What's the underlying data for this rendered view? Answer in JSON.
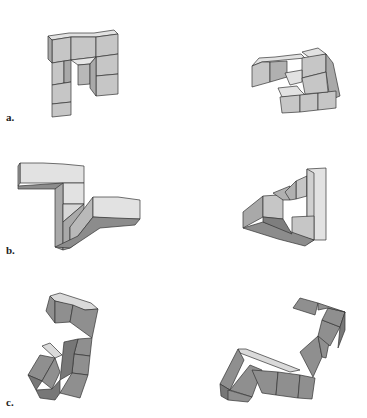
{
  "figure": {
    "colors": {
      "top_light": "#e2e2e2",
      "front_mid": "#c6c6c6",
      "side_dark": "#a9a9a9",
      "shadow": "#8c8c8c",
      "c_top": "#dadada",
      "c_front": "#8f8f8f",
      "c_side": "#777777",
      "edge": "#333333"
    },
    "rows": [
      {
        "id": "a",
        "label": "a.",
        "label_pos": [
          6,
          118
        ]
      },
      {
        "id": "b",
        "label": "b.",
        "label_pos": [
          6,
          250
        ]
      },
      {
        "id": "c",
        "label": "c.",
        "label_pos": [
          6,
          400
        ]
      }
    ],
    "polygons": [
      {
        "f": "#e2e2e2",
        "p": "48,36 69,33 94,33 114,30 118,34 96,37 71,37 52,40"
      },
      {
        "f": "#c6c6c6",
        "p": "52,40 71,37 71,60 52,63"
      },
      {
        "f": "#c6c6c6",
        "p": "71,37 96,37 96,57 71,60"
      },
      {
        "f": "#c6c6c6",
        "p": "96,37 118,34 118,54 96,57"
      },
      {
        "f": "#a9a9a9",
        "p": "48,36 52,40 52,63 48,59"
      },
      {
        "f": "#c6c6c6",
        "p": "52,63 64,61 64,83 52,85"
      },
      {
        "f": "#a9a9a9",
        "p": "64,61 71,60 71,82 64,83"
      },
      {
        "f": "#c6c6c6",
        "p": "52,85 71,82 71,102 52,104"
      },
      {
        "f": "#c6c6c6",
        "p": "52,104 71,102 71,115 52,117"
      },
      {
        "f": "#e6e6e6",
        "p": "71,60 96,57 90,64 78,65"
      },
      {
        "f": "#b8b8b8",
        "p": "78,65 90,64 90,84 78,85"
      },
      {
        "f": "#c6c6c6",
        "p": "96,57 118,54 118,74 96,76"
      },
      {
        "f": "#c6c6c6",
        "p": "96,76 118,74 118,94 96,96"
      },
      {
        "f": "#a9a9a9",
        "p": "90,64 96,57 96,96 90,88"
      },
      {
        "f": "#e2e2e2",
        "p": "252,66 259,58 275,57 292,55 301,54 305,58 262,62"
      },
      {
        "f": "#c6c6c6",
        "p": "252,66 262,62 270,62 270,82 252,87"
      },
      {
        "f": "#b0b0b0",
        "p": "270,62 287,61 287,77 270,82"
      },
      {
        "f": "#e2e2e2",
        "p": "302,52 318,48 326,54 310,58"
      },
      {
        "f": "#c6c6c6",
        "p": "302,58 326,54 326,72 302,78"
      },
      {
        "f": "#a9a9a9",
        "p": "326,54 333,63 340,96 330,100 326,72"
      },
      {
        "f": "#e2e2e2",
        "p": "285,73 302,70 302,82 290,85"
      },
      {
        "f": "#e2e2e2",
        "p": "278,88 297,86 300,90 305,95 282,97"
      },
      {
        "f": "#c6c6c6",
        "p": "280,97 300,95 300,112 282,113"
      },
      {
        "f": "#c6c6c6",
        "p": "300,95 318,93 318,110 300,112"
      },
      {
        "f": "#c6c6c6",
        "p": "318,93 336,91 336,108 318,110"
      },
      {
        "f": "#c6c6c6",
        "p": "302,78 326,72 328,92 305,94"
      },
      {
        "f": "#e2e2e2",
        "p": "20,163 43,163 63,164 84,166 84,183 63,183 43,183 20,183"
      },
      {
        "f": "#a9a9a9",
        "p": "18,166 20,163 20,183 18,186"
      },
      {
        "f": "#8c8c8c",
        "p": "18,186 63,183 60,189 18,189"
      },
      {
        "f": "#e2e2e2",
        "p": "63,183 84,183 84,204 63,204"
      },
      {
        "f": "#a9a9a9",
        "p": "55,189 63,183 63,250 55,247"
      },
      {
        "f": "#d8d8d8",
        "p": "63,204 84,204 63,222"
      },
      {
        "f": "#a9a9a9",
        "p": "63,222 84,204 84,215 70,227 70,248 63,250"
      },
      {
        "f": "#b9b9b9",
        "p": "70,227 93,197 93,217 78,236 78,242 70,248"
      },
      {
        "f": "#e2e2e2",
        "p": "93,197 118,197 140,200 140,219 118,219 93,217"
      },
      {
        "f": "#8c8c8c",
        "p": "78,236 93,217 140,219 135,225 100,228 70,248 55,247"
      },
      {
        "f": "#a9a9a9",
        "p": "243,212 263,196 263,217 243,228"
      },
      {
        "f": "#c6c6c6",
        "p": "263,196 278,195 283,200 283,219 263,217"
      },
      {
        "f": "#b0b0b0",
        "p": "273,193 290,186 290,200 283,200"
      },
      {
        "f": "#c6c6c6",
        "p": "296,181 307,176 307,196 296,199"
      },
      {
        "f": "#b0b0b0",
        "p": "285,192 296,181 296,199 290,200"
      },
      {
        "f": "#e2e2e2",
        "p": "307,169 326,168 326,240 307,240"
      },
      {
        "f": "#d0d0d0",
        "p": "307,169 314,173 314,240 307,244"
      },
      {
        "f": "#c6c6c6",
        "p": "292,217 314,216 314,240 292,234"
      },
      {
        "f": "#8c8c8c",
        "p": "243,228 263,222 314,240 305,246 278,239"
      },
      {
        "f": "#7e7e7e",
        "p": "263,217 283,219 292,234 263,222"
      },
      {
        "f": "#dadada",
        "p": "50,296 60,293 91,303 98,309 85,310 55,301"
      },
      {
        "f": "#8f8f8f",
        "p": "46,311 50,296 55,301 55,323"
      },
      {
        "f": "#8f8f8f",
        "p": "55,301 73,305 70,322 55,323"
      },
      {
        "f": "#8f8f8f",
        "p": "73,305 85,310 98,309 92,338 70,322"
      },
      {
        "f": "#8f8f8f",
        "p": "78,339 92,338 90,356 74,354"
      },
      {
        "f": "#8f8f8f",
        "p": "74,354 90,356 88,375 72,373"
      },
      {
        "f": "#8f8f8f",
        "p": "72,373 88,375 80,398 60,393"
      },
      {
        "f": "#777777",
        "p": "64,342 78,339 74,354 72,373 60,380"
      },
      {
        "f": "#dadada",
        "p": "42,346 50,343 62,355 55,358"
      },
      {
        "f": "#8f8f8f",
        "p": "28,375 40,355 55,358 42,381"
      },
      {
        "f": "#777777",
        "p": "28,375 42,381 36,390"
      },
      {
        "f": "#8f8f8f",
        "p": "42,381 55,358 60,372 52,389"
      },
      {
        "f": "#777777",
        "p": "36,390 52,389 60,380 60,393 55,400 40,398"
      },
      {
        "f": "#dadada",
        "p": "238,349 246,349 290,366 300,370 290,372 240,353"
      },
      {
        "f": "#8f8f8f",
        "p": "220,384 238,349 244,360 230,390"
      },
      {
        "f": "#8f8f8f",
        "p": "230,390 250,365 262,370 252,397"
      },
      {
        "f": "#8f8f8f",
        "p": "252,370 278,372 276,395 262,393"
      },
      {
        "f": "#8f8f8f",
        "p": "278,372 300,375 298,398 276,395"
      },
      {
        "f": "#8f8f8f",
        "p": "300,375 315,378 312,399 298,398"
      },
      {
        "f": "#777777",
        "p": "220,384 230,390 228,400 221,396"
      },
      {
        "f": "#8f8f8f",
        "p": "228,390 252,397 248,402 228,400"
      },
      {
        "f": "#8f8f8f",
        "p": "300,352 318,336 322,357 313,377"
      },
      {
        "f": "#8f8f8f",
        "p": "318,336 330,338 326,358 322,357"
      },
      {
        "f": "#8f8f8f",
        "p": "322,320 340,327 330,346 318,336"
      },
      {
        "f": "#8f8f8f",
        "p": "328,308 345,312 340,327 322,320"
      },
      {
        "f": "#8f8f8f",
        "p": "293,308 300,298 318,303 315,315"
      },
      {
        "f": "#8f8f8f",
        "p": "318,303 345,312 328,308 318,310"
      },
      {
        "f": "#777777",
        "p": "340,327 345,312 345,330 338,348"
      }
    ]
  }
}
